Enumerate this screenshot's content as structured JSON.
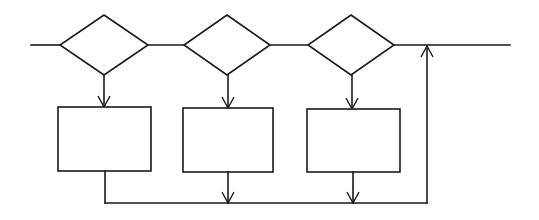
{
  "diagram": {
    "type": "flowchart",
    "background": "#ffffff",
    "stroke_color": "#1a1a1a",
    "main_line": {
      "y": 45,
      "x1": 31,
      "x2": 510
    },
    "decisions": [
      {
        "id": "decision-1",
        "label": "",
        "cx": 104,
        "cy": 45,
        "half_w": 44,
        "half_h": 30
      },
      {
        "id": "decision-2",
        "label": "",
        "cx": 227,
        "cy": 45,
        "half_w": 43,
        "half_h": 30
      },
      {
        "id": "decision-3",
        "label": "",
        "cx": 351,
        "cy": 45,
        "half_w": 43,
        "half_h": 30
      }
    ],
    "processes": [
      {
        "id": "process-1",
        "label": "",
        "x": 58,
        "y": 107,
        "w": 93,
        "h": 64
      },
      {
        "id": "process-2",
        "label": "",
        "x": 183,
        "y": 108,
        "w": 90,
        "h": 64
      },
      {
        "id": "process-3",
        "label": "",
        "x": 307,
        "y": 109,
        "w": 93,
        "h": 63
      }
    ],
    "return_line": {
      "y": 203,
      "x1": 104,
      "x2": 427,
      "up_x": 427
    }
  }
}
